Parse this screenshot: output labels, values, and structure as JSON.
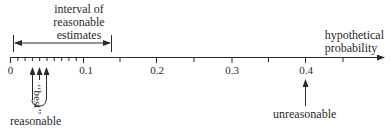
{
  "diagram": {
    "type": "number-line",
    "axis": {
      "label_lines": [
        "hypothetical",
        "probability"
      ],
      "ticks": [
        {
          "value": 0,
          "label": "0"
        },
        {
          "value": 0.1,
          "label": "0.1"
        },
        {
          "value": 0.2,
          "label": "0.2"
        },
        {
          "value": 0.3,
          "label": "0.3"
        },
        {
          "value": 0.4,
          "label": "0.4"
        }
      ],
      "minor_tick_step_0_to_0_1": 0.01,
      "minor_tick_step_after_0_1": 0.05,
      "range": [
        0,
        0.5
      ]
    },
    "interval": {
      "label_lines": [
        "interval of",
        "reasonable",
        "estimates"
      ],
      "start": 0.005,
      "end": 0.135
    },
    "markers": {
      "best": {
        "label": "‘‘best’’",
        "values": [
          0.03,
          0.04,
          0.05
        ]
      },
      "reasonable": {
        "label": "reasonable"
      },
      "unreasonable": {
        "label": "unreasonable",
        "value": 0.4
      }
    },
    "colors": {
      "ink": "#2a2a2a",
      "background": "#ffffff"
    }
  }
}
